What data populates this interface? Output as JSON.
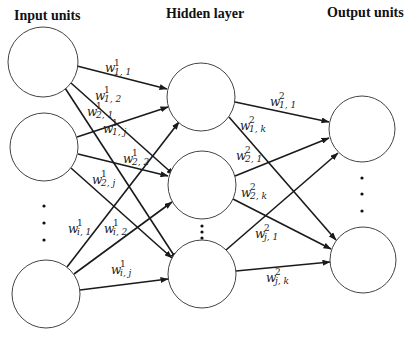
{
  "headers": {
    "input": "Input units",
    "hidden": "Hidden layer",
    "output": "Output units"
  },
  "weights": {
    "w1_11": {
      "base": "w",
      "sup": "1",
      "sub": "1, 1"
    },
    "w1_12": {
      "base": "w",
      "sup": "1",
      "sub": "1, 2"
    },
    "w1_21": {
      "base": "w",
      "sup": "1",
      "sub": "2, 1"
    },
    "w1_1j": {
      "base": "w",
      "sup": "1",
      "sub": "1, j"
    },
    "w1_22": {
      "base": "w",
      "sup": "1",
      "sub": "2, 2"
    },
    "w1_2j": {
      "base": "w",
      "sup": "1",
      "sub": "2, j"
    },
    "w1_i1": {
      "base": "w",
      "sup": "1",
      "sub": "i, 1"
    },
    "w1_i2": {
      "base": "w",
      "sup": "1",
      "sub": "i, 2"
    },
    "w1_ij": {
      "base": "w",
      "sup": "1",
      "sub": "i, j"
    },
    "w2_11": {
      "base": "w",
      "sup": "2",
      "sub": "1, 1"
    },
    "w2_1k": {
      "base": "w",
      "sup": "2",
      "sub": "1, k"
    },
    "w2_21": {
      "base": "w",
      "sup": "2",
      "sub": "2, 1"
    },
    "w2_2k": {
      "base": "w",
      "sup": "2",
      "sub": "2, k"
    },
    "w2_j1": {
      "base": "w",
      "sup": "2",
      "sub": "j, 1"
    },
    "w2_jk": {
      "base": "w",
      "sup": "2",
      "sub": "j, k"
    }
  },
  "layers": {
    "input": {
      "nodes": 3,
      "ellipsis": true
    },
    "hidden": {
      "nodes": 3,
      "ellipsis": true
    },
    "output": {
      "nodes": 2,
      "ellipsis": true
    }
  }
}
